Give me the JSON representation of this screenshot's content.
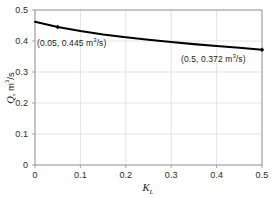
{
  "chart_data": {
    "type": "line",
    "title": "",
    "xlabel": "K_L",
    "ylabel": "Q, m^3/s",
    "xlim": [
      0,
      0.5
    ],
    "ylim": [
      0,
      0.5
    ],
    "grid": true,
    "legend": "none",
    "x": [
      0,
      0.05,
      0.1,
      0.15,
      0.2,
      0.25,
      0.3,
      0.35,
      0.4,
      0.45,
      0.5
    ],
    "values": [
      0.462,
      0.445,
      0.432,
      0.421,
      0.412,
      0.404,
      0.397,
      0.39,
      0.384,
      0.378,
      0.372
    ],
    "series": [
      {
        "name": "Q vs K_L",
        "values": [
          0.462,
          0.445,
          0.432,
          0.421,
          0.412,
          0.404,
          0.397,
          0.39,
          0.384,
          0.378,
          0.372
        ]
      }
    ],
    "markers": [
      {
        "x": 0.05,
        "y": 0.445,
        "label": "(0.05, 0.445 m3/s)"
      },
      {
        "x": 0.5,
        "y": 0.372,
        "label": "(0.5, 0.372 m3/s)"
      }
    ],
    "xticks": [
      "0",
      "0.1",
      "0.2",
      "0.3",
      "0.4",
      "0.5"
    ],
    "xtick_values": [
      0,
      0.1,
      0.2,
      0.3,
      0.4,
      0.5
    ],
    "yticks": [
      "0",
      "0.1",
      "0.2",
      "0.3",
      "0.4",
      "0.5"
    ],
    "ytick_values": [
      0,
      0.1,
      0.2,
      0.3,
      0.4,
      0.5
    ],
    "line_color": "#000000",
    "marker_color": "#000000",
    "grid_color": "#dcdcdc",
    "axis_color": "#9a9a9a",
    "background": "#ffffff"
  },
  "axes": {
    "x_title_symbol": "K",
    "x_title_subscript": "L",
    "y_title_symbol": "Q",
    "y_title_rest": ", m",
    "y_title_sup": "3",
    "y_title_tail": "/s"
  },
  "annotations": {
    "left": {
      "prefix": "(0.05, 0.445 m",
      "sup": "3",
      "suffix": "/s)"
    },
    "right": {
      "prefix": "(0.5, 0.372 m",
      "sup": "3",
      "suffix": "/s)"
    }
  },
  "ticks": {
    "x": [
      "0",
      "0.1",
      "0.2",
      "0.3",
      "0.4",
      "0.5"
    ],
    "y": [
      "0",
      "0.1",
      "0.2",
      "0.3",
      "0.4",
      "0.5"
    ]
  }
}
